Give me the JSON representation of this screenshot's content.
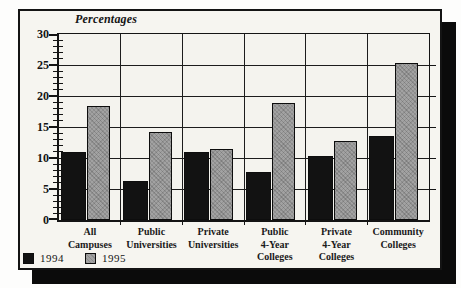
{
  "chart_data": {
    "type": "bar",
    "title": "Percentages",
    "categories": [
      "All Campuses",
      "Public Universities",
      "Private Universities",
      "Public 4-Year Colleges",
      "Private 4-Year Colleges",
      "Community Colleges"
    ],
    "categories_multiline": [
      [
        "All",
        "Campuses"
      ],
      [
        "Public",
        "Universities"
      ],
      [
        "Private",
        "Universities"
      ],
      [
        "Public",
        "4-Year",
        "Colleges"
      ],
      [
        "Private",
        "4-Year",
        "Colleges"
      ],
      [
        "Community",
        "Colleges"
      ]
    ],
    "series": [
      {
        "name": "1994",
        "color": "#121212",
        "values": [
          11,
          6.3,
          11,
          7.7,
          10.4,
          13.6
        ]
      },
      {
        "name": "1995",
        "color": "#a2a2a2",
        "values": [
          18.4,
          14.2,
          11.5,
          18.9,
          12.7,
          25.4
        ]
      }
    ],
    "ylabel": "Percentages",
    "ylim": [
      0,
      30
    ],
    "yticks": [
      0,
      5,
      10,
      15,
      20,
      25,
      30
    ],
    "ytick_step": 5,
    "minor_tick_step": 1,
    "grid": true,
    "legend_entries": [
      "1994",
      "1995"
    ],
    "legend_position": "bottom-left"
  },
  "colors": {
    "bar_1994": "#121212",
    "bar_1995": "#a2a2a2",
    "panel_background": "#f6f5f0",
    "drop_shadow": "#0b0b0b",
    "line": "#141414"
  }
}
